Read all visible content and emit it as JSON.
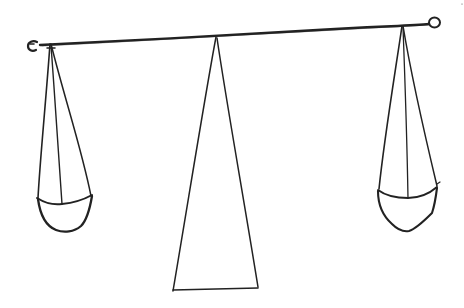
{
  "image": {
    "description": "Hand-drawn line sketch of a balance scale",
    "width": 464,
    "height": 308,
    "colors": {
      "background": "#ffffff",
      "ink": "#222222"
    }
  },
  "drawing": {
    "beam": {
      "label": "balance beam",
      "left_end": [
        40,
        45
      ],
      "right_end": [
        430,
        25
      ],
      "stroke_width": 2.2
    },
    "left_ring": {
      "label": "left end ring",
      "center": [
        33,
        46
      ],
      "radius": 5
    },
    "right_ring": {
      "label": "right end ring",
      "center": [
        435,
        23
      ],
      "radius": 6
    },
    "fulcrum": {
      "label": "triangular stand",
      "apex": [
        216,
        37
      ],
      "base_left": [
        173,
        290
      ],
      "base_right": [
        258,
        288
      ]
    },
    "left_pan": {
      "label": "left pan",
      "hanger_top": [
        50,
        44
      ],
      "rim_left": [
        37,
        198
      ],
      "rim_right": [
        92,
        196
      ]
    },
    "right_pan": {
      "label": "right pan",
      "hanger_top": [
        402,
        26
      ],
      "rim_left": [
        378,
        190
      ],
      "rim_right": [
        438,
        186
      ]
    }
  }
}
